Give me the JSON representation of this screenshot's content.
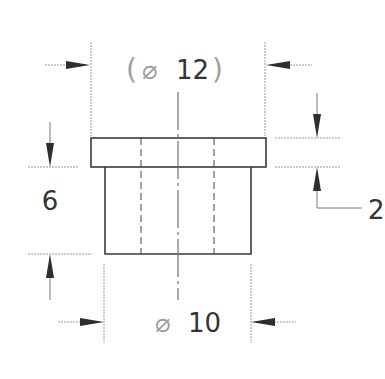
{
  "drawing": {
    "type": "orthographic-view",
    "part": "flanged bushing",
    "dimensions": {
      "flange_diameter": {
        "symbol": "⌀",
        "value": "12",
        "reference": true,
        "open_paren": "(",
        "close_paren": ")"
      },
      "body_diameter": {
        "symbol": "⌀",
        "value": "10"
      },
      "body_height": {
        "value": "6"
      },
      "flange_thickness": {
        "value": "2"
      }
    },
    "colors": {
      "outline": "#3a3a3a",
      "dimension_line": "#7a7a7a",
      "text": "#333333",
      "reference_text": "#a0a0a0",
      "background": "#ffffff"
    }
  }
}
